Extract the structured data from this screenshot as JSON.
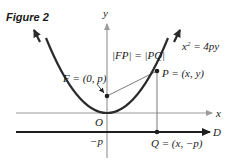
{
  "figure": {
    "title": "Figure 2"
  },
  "axes": {
    "x_label": "x",
    "y_label": "y",
    "origin_label": "O",
    "neg_p_label": "−p"
  },
  "directrix": {
    "label": "D"
  },
  "curve": {
    "equation_lhs": "x",
    "equation_exp": "2",
    "equation_rhs": " = 4py"
  },
  "points": {
    "focus": "F = (0, p)",
    "point_p": "P = (x, y)",
    "point_q": "Q = (x, −p)"
  },
  "relation": {
    "text": "|FP| = |PQ|"
  },
  "colors": {
    "curve": "#2b2b2b",
    "axes": "#9a9a9a",
    "directrix": "#1f1f1f",
    "segments": "#7a7a7a"
  }
}
